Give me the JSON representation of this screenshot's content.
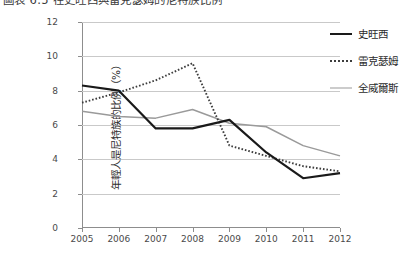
{
  "figure": {
    "caption": "圖表 6.5 在史旺西與雷克瑟姆的尼特族比例"
  },
  "chart_data": {
    "type": "line",
    "title": "圖表 6.5 在史旺西與雷克瑟姆的尼特族比例",
    "xlabel": "",
    "ylabel": "年輕人是尼特族的比例（%）",
    "categories": [
      "2005",
      "2006",
      "2007",
      "2008",
      "2009",
      "2010",
      "2011",
      "2012"
    ],
    "x": [
      2005,
      2006,
      2007,
      2008,
      2009,
      2010,
      2011,
      2012
    ],
    "ylim": [
      0,
      12
    ],
    "yticks": [
      0,
      2,
      4,
      6,
      8,
      10,
      12
    ],
    "grid": true,
    "legend_position": "right",
    "series": [
      {
        "name": "史旺西",
        "style": "solid",
        "color": "#1a1a1a",
        "values": [
          8.3,
          8.0,
          5.8,
          5.8,
          6.3,
          4.4,
          2.9,
          3.2
        ]
      },
      {
        "name": "雷克瑟姆",
        "style": "dotted",
        "color": "#3d3d3d",
        "values": [
          7.3,
          7.9,
          8.6,
          9.6,
          4.8,
          4.2,
          3.6,
          3.3
        ]
      },
      {
        "name": "全威爾斯",
        "style": "solid",
        "color": "#9a9a9a",
        "values": [
          6.8,
          6.5,
          6.4,
          6.9,
          6.1,
          5.9,
          4.8,
          4.2
        ]
      }
    ]
  },
  "axis": {
    "ytick_labels": [
      "12",
      "10",
      "8",
      "6",
      "4",
      "2",
      "0"
    ],
    "xtick_labels": [
      "2005",
      "2006",
      "2007",
      "2008",
      "2009",
      "2010",
      "2011",
      "2012"
    ],
    "ylabel": "年輕人是尼特族的比例（%）"
  },
  "legend": {
    "items": [
      {
        "label": "史旺西",
        "swatch": "solid-black-line-icon"
      },
      {
        "label": "雷克瑟姆",
        "swatch": "dotted-black-line-icon"
      },
      {
        "label": "全威爾斯",
        "swatch": "solid-gray-line-icon"
      }
    ]
  }
}
